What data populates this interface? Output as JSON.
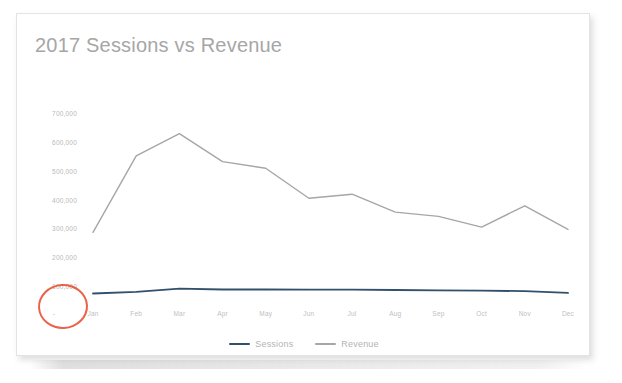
{
  "card": {
    "title": "2017 Sessions vs Revenue"
  },
  "annotation": {
    "zero_label": "-",
    "circle_color": "#e8553a",
    "name": "red-circle-highlight"
  },
  "legend": {
    "position": "bottom-center",
    "entries": [
      {
        "label": "Sessions",
        "color": "#31506b"
      },
      {
        "label": "Revenue",
        "color": "#a6a6a6"
      }
    ]
  },
  "chart_data": {
    "type": "line",
    "title": "2017 Sessions vs Revenue",
    "xlabel": "",
    "ylabel": "",
    "grid": false,
    "legend_position": "bottom-center",
    "categories": [
      "Jan",
      "Feb",
      "Mar",
      "Apr",
      "May",
      "Jun",
      "Jul",
      "Aug",
      "Sep",
      "Oct",
      "Nov",
      "Dec"
    ],
    "ylim": [
      0,
      700000
    ],
    "ytick_labels": [
      "700,000",
      "600,000",
      "500,000",
      "400,000",
      "300,000",
      "200,000",
      "100,000",
      "-"
    ],
    "ytick_values": [
      700000,
      600000,
      500000,
      400000,
      300000,
      200000,
      100000,
      0
    ],
    "series": [
      {
        "name": "Sessions",
        "color": "#31506b",
        "values": [
          78000,
          84000,
          95000,
          92000,
          92000,
          91000,
          91000,
          90000,
          89000,
          88000,
          86000,
          80000
        ]
      },
      {
        "name": "Revenue",
        "color": "#a6a6a6",
        "values": [
          290000,
          555000,
          632000,
          535000,
          512000,
          408000,
          422000,
          360000,
          345000,
          308000,
          382000,
          300000
        ]
      }
    ]
  }
}
